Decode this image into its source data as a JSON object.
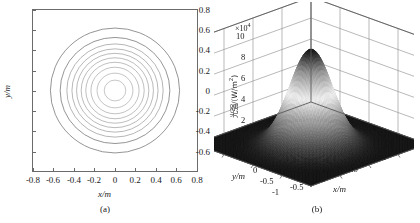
{
  "figure": {
    "panels": [
      {
        "id": "a",
        "caption": "(a)",
        "type": "contour",
        "xlabel": "x/m",
        "ylabel": "y/m"
      },
      {
        "id": "b",
        "caption": "(b)",
        "type": "surface",
        "xlabel": "x/m",
        "ylabel": "y/m",
        "zlabel": "光强/(W/m²)",
        "z_exponent_prefix": "×10",
        "z_exponent_power": "4"
      }
    ]
  },
  "chart_data": [
    {
      "type": "line",
      "subtype": "contour",
      "panel": "a",
      "title": "",
      "caption": "(a)",
      "xlabel": "x/m",
      "ylabel": "y/m",
      "xlim": [
        -0.8,
        0.8
      ],
      "ylim": [
        -0.8,
        0.8
      ],
      "xticks": [
        "-0.8",
        "-0.6",
        "-0.4",
        "-0.2",
        "0",
        "0.2",
        "0.4",
        "0.6",
        "0.8"
      ],
      "xtick_values": [
        -0.8,
        -0.6,
        -0.4,
        -0.2,
        0,
        0.2,
        0.4,
        0.6,
        0.8
      ],
      "yticks": [
        "0.8",
        "0.6",
        "0.4",
        "0.2",
        "0",
        "-0.2",
        "-0.4",
        "-0.6"
      ],
      "ytick_values": [
        0.8,
        0.6,
        0.4,
        0.2,
        0,
        -0.2,
        -0.4,
        -0.6
      ],
      "grid": false,
      "legend": "none",
      "contour_center": [
        0.0,
        0.0
      ],
      "contour_radii_m": [
        0.63,
        0.535,
        0.47,
        0.42,
        0.375,
        0.33,
        0.285,
        0.235,
        0.175,
        0.105
      ],
      "contour_count": 10,
      "contour_color": "#7a7a7a",
      "description": "Concentric near-circular contour rings of a radially symmetric Gaussian intensity distribution centred at the origin."
    },
    {
      "type": "heatmap",
      "subtype": "surface3d",
      "panel": "b",
      "title": "",
      "caption": "(b)",
      "xlabel": "x/m",
      "ylabel": "y/m",
      "zlabel": "光强/(W/m²)",
      "z_exponent": "×10⁴",
      "xlim": [
        -1,
        1
      ],
      "ylim": [
        -1,
        1
      ],
      "zlim": [
        0,
        10
      ],
      "xticks": [
        "-1",
        "-0.5",
        "0",
        "0.5",
        "1"
      ],
      "xtick_values": [
        -1,
        -0.5,
        0,
        0.5,
        1
      ],
      "yticks": [
        "1",
        "0.5",
        "0",
        "-0.5",
        "-1"
      ],
      "ytick_values": [
        1,
        0.5,
        0,
        -0.5,
        -1
      ],
      "zticks": [
        "0",
        "2",
        "4",
        "6",
        "8",
        "10"
      ],
      "ztick_values": [
        0,
        2,
        4,
        6,
        8,
        10
      ],
      "grid": true,
      "legend": "none",
      "peak_value": 9.0,
      "peak_position": [
        0.0,
        0.0
      ],
      "gaussian_sigma_m": 0.26,
      "colormap": "grayscale",
      "description": "Three-dimensional grayscale surface of a single Gaussian light-intensity peak of about 9×10⁴ W/m² at the origin, decaying to near zero at the plot edges."
    }
  ]
}
